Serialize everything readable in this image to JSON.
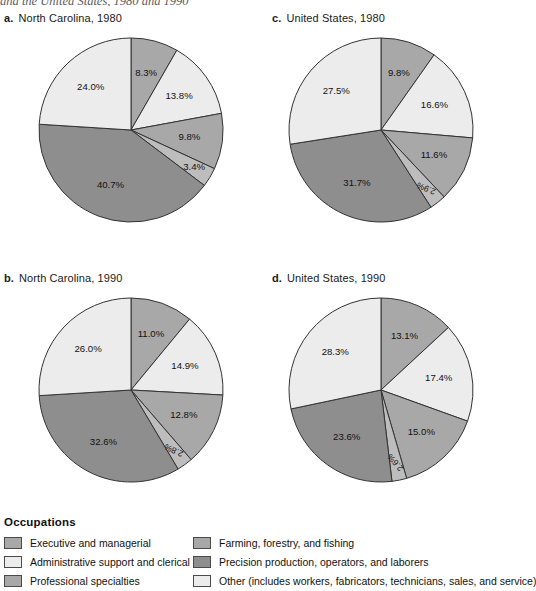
{
  "top_caption": "and the United States, 1980 and 1990",
  "legend": {
    "title": "Occupations",
    "items": [
      {
        "id": "exec",
        "label": "Executive and managerial",
        "color": "#a8a8a8",
        "column": 1
      },
      {
        "id": "admin",
        "label": "Administrative support and clerical",
        "color": "#ececec",
        "column": 1
      },
      {
        "id": "prof",
        "label": "Professional specialties",
        "color": "#a8a8a8",
        "column": 1
      },
      {
        "id": "farm",
        "label": "Farming, forestry, and fishing",
        "color": "#a8a8a8",
        "column": 2
      },
      {
        "id": "precision",
        "label": "Precision production, operators, and laborers",
        "color": "#8e8e8e",
        "column": 2
      },
      {
        "id": "other",
        "label": "Other (includes workers, fabricators, technicians, sales, and service)",
        "color": "#ececec",
        "column": 2
      }
    ]
  },
  "chart_data": [
    {
      "id": "a",
      "key": "a.",
      "title": "North Carolina, 1980",
      "type": "pie",
      "categories": [
        "Executive and managerial",
        "Administrative support and clerical",
        "Professional specialties",
        "Farming, forestry, and fishing",
        "Precision production, operators, and laborers",
        "Other"
      ],
      "values": [
        8.3,
        13.8,
        9.8,
        3.4,
        40.7,
        24.0
      ],
      "labels": [
        "8.3%",
        "13.8%",
        "9.8%",
        "3.4%",
        "40.7%",
        "24.0%"
      ],
      "colors": [
        "#a8a8a8",
        "#ececec",
        "#a8a8a8",
        "#bdbdbd",
        "#8e8e8e",
        "#ececec"
      ],
      "label_rotated": [
        false,
        false,
        false,
        false,
        false,
        false
      ]
    },
    {
      "id": "b",
      "key": "b.",
      "title": "North Carolina, 1990",
      "type": "pie",
      "categories": [
        "Executive and managerial",
        "Administrative support and clerical",
        "Professional specialties",
        "Farming, forestry, and fishing",
        "Precision production, operators, and laborers",
        "Other"
      ],
      "values": [
        11.0,
        14.9,
        12.8,
        2.8,
        32.6,
        26.0
      ],
      "labels": [
        "11.0%",
        "14.9%",
        "12.8%",
        "2.8%",
        "32.6%",
        "26.0%"
      ],
      "colors": [
        "#a8a8a8",
        "#ececec",
        "#a8a8a8",
        "#bdbdbd",
        "#8e8e8e",
        "#ececec"
      ],
      "label_rotated": [
        false,
        false,
        false,
        true,
        false,
        false
      ]
    },
    {
      "id": "c",
      "key": "c.",
      "title": "United States, 1980",
      "type": "pie",
      "categories": [
        "Executive and managerial",
        "Administrative support and clerical",
        "Professional specialties",
        "Farming, forestry, and fishing",
        "Precision production, operators, and laborers",
        "Other"
      ],
      "values": [
        9.8,
        16.6,
        11.6,
        2.9,
        31.7,
        27.5
      ],
      "labels": [
        "9.8%",
        "16.6%",
        "11.6%",
        "2.9%",
        "31.7%",
        "27.5%"
      ],
      "colors": [
        "#a8a8a8",
        "#ececec",
        "#a8a8a8",
        "#bdbdbd",
        "#8e8e8e",
        "#ececec"
      ],
      "label_rotated": [
        false,
        false,
        false,
        true,
        false,
        false
      ]
    },
    {
      "id": "d",
      "key": "d.",
      "title": "United States, 1990",
      "type": "pie",
      "categories": [
        "Executive and managerial",
        "Administrative support and clerical",
        "Professional specialties",
        "Farming, forestry, and fishing",
        "Precision production, operators, and laborers",
        "Other"
      ],
      "values": [
        13.1,
        17.4,
        15.0,
        2.6,
        23.6,
        28.3
      ],
      "labels": [
        "13.1%",
        "17.4%",
        "15.0%",
        "2.6%",
        "23.6%",
        "28.3%"
      ],
      "colors": [
        "#a8a8a8",
        "#ececec",
        "#a8a8a8",
        "#bdbdbd",
        "#8e8e8e",
        "#ececec"
      ],
      "label_rotated": [
        false,
        false,
        false,
        true,
        false,
        false
      ]
    }
  ],
  "layout": {
    "charts": [
      {
        "id": "a",
        "block_left": 4,
        "block_top": 12,
        "cx": 131,
        "cy": 130,
        "r": 92
      },
      {
        "id": "b",
        "block_left": 4,
        "block_top": 272,
        "cx": 131,
        "cy": 390,
        "r": 92
      },
      {
        "id": "c",
        "block_left": 272,
        "block_top": 12,
        "cx": 381,
        "cy": 130,
        "r": 92
      },
      {
        "id": "d",
        "block_left": 272,
        "block_top": 272,
        "cx": 381,
        "cy": 390,
        "r": 92
      }
    ],
    "stroke": "#333333",
    "label_radius_factor": 0.64
  }
}
